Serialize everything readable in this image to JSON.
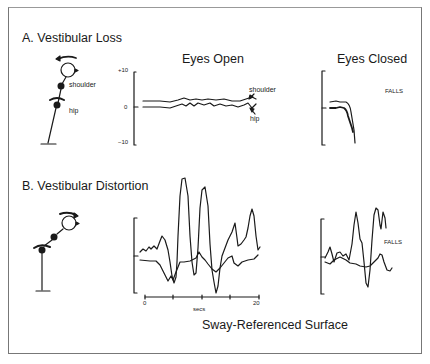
{
  "panel_a": {
    "title": "A. Vestibular Loss",
    "eyes_open_title": "Eyes Open",
    "eyes_closed_title": "Eyes Closed",
    "y_ticks": [
      "+10",
      "0",
      "−10"
    ],
    "figure_labels": {
      "shoulder": "shoulder",
      "hip": "hip"
    },
    "trace_labels": {
      "shoulder": "shoulder",
      "hip": "hip"
    },
    "eyes_closed_annotation": "FALLS"
  },
  "panel_b": {
    "title": "B. Vestibular Distortion",
    "eyes_closed_annotation": "FALLS",
    "x_ticks": [
      "0",
      "20"
    ],
    "x_label": "secs"
  },
  "footer": {
    "caption": "Sway-Referenced Surface"
  },
  "icons": {
    "figure_a": "stick-figure-upright-icon",
    "figure_b": "stick-figure-leaning-icon",
    "rotation_arrow": "curved-arrow-icon"
  },
  "colors": {
    "line": "#1a1a1a",
    "frame": "#777777",
    "background": "#ffffff"
  }
}
